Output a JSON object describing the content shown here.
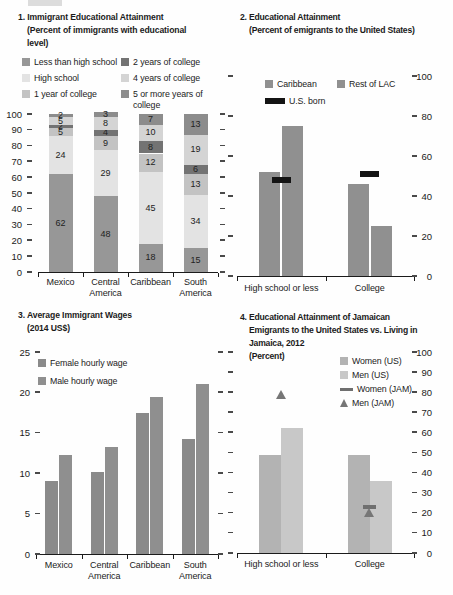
{
  "figure": {
    "kind": "four-panel statistical figure on immigrant education and wages"
  },
  "panels": {
    "p1": {
      "title_lines": [
        "1. Immigrant Educational Attainment",
        "(Percent of immigrants with educational",
        "level)"
      ],
      "legend": [
        {
          "label": "Less than high school",
          "color": "#979797"
        },
        {
          "label": "High school",
          "color": "#e3e3e3"
        },
        {
          "label": "1 year of college",
          "color": "#c3c3c3"
        },
        {
          "label": "2 years of college",
          "color": "#737373"
        },
        {
          "label": "4 years of college",
          "color": "#d4d4d4"
        },
        {
          "label": "5 or more years of college",
          "color": "#8c8c8c"
        }
      ]
    },
    "p2": {
      "title_lines": [
        "2. Educational Attainment",
        "(Percent of emigrants to the United States)"
      ],
      "legend": [
        {
          "label": "Caribbean",
          "color": "#909090"
        },
        {
          "label": "Rest of LAC",
          "color": "#909090"
        },
        {
          "label": "U.S. born",
          "color": "#141414"
        }
      ]
    },
    "p3": {
      "title_lines": [
        "3. Average Immigrant Wages",
        "(2014 US$)"
      ],
      "legend": [
        {
          "label": "Female hourly wage",
          "color": "#8a8a8a"
        },
        {
          "label": "Male hourly wage",
          "color": "#8f8f8f"
        }
      ]
    },
    "p4": {
      "title_lines": [
        "4. Educational Attainment of Jamaican",
        "Emigrants to the United States vs. Living in",
        "Jamaica, 2012",
        "(Percent)"
      ],
      "legend": [
        {
          "label": "Women (US)",
          "color": "#b3b3b3"
        },
        {
          "label": "Men (US)",
          "color": "#c8c8c8"
        },
        {
          "label": "Women (JAM)",
          "color": "#6f6f6f"
        },
        {
          "label": "Men (JAM)",
          "color": "#767676"
        }
      ]
    }
  },
  "chart_data": [
    {
      "id": "p1",
      "type": "bar",
      "subtype": "stacked",
      "title": "1. Immigrant Educational Attainment (Percent of immigrants with educational level)",
      "categories": [
        [
          "Mexico"
        ],
        [
          "Central",
          "America"
        ],
        [
          "Caribbean"
        ],
        [
          "South",
          "America"
        ]
      ],
      "series": [
        {
          "name": "Less than high school",
          "color": "#979797",
          "values": [
            62,
            48,
            18,
            15
          ]
        },
        {
          "name": "High school",
          "color": "#e3e3e3",
          "values": [
            24,
            29,
            45,
            34
          ]
        },
        {
          "name": "1 year of college",
          "color": "#c3c3c3",
          "values": [
            5,
            9,
            12,
            13
          ]
        },
        {
          "name": "2 years of college",
          "color": "#737373",
          "values": [
            2,
            4,
            8,
            6
          ]
        },
        {
          "name": "4 years of college",
          "color": "#d4d4d4",
          "values": [
            5,
            8,
            10,
            19
          ]
        },
        {
          "name": "5 or more years of college",
          "color": "#8c8c8c",
          "values": [
            2,
            3,
            7,
            13
          ]
        }
      ],
      "show_values": true,
      "ylim": [
        0,
        100
      ],
      "ticks": [
        0,
        10,
        20,
        30,
        40,
        50,
        60,
        70,
        80,
        90,
        100
      ],
      "axis_label_side": "left"
    },
    {
      "id": "p2",
      "type": "bar",
      "subtype": "grouped",
      "title": "2. Educational Attainment (Percent of emigrants to the United States)",
      "categories": [
        [
          "High school or less"
        ],
        [
          "College"
        ]
      ],
      "series": [
        {
          "name": "Caribbean",
          "color": "#909090",
          "values": [
            52,
            46
          ]
        },
        {
          "name": "Rest of LAC",
          "color": "#909090",
          "values": [
            75,
            25
          ]
        }
      ],
      "markers": [
        {
          "name": "U.S. born",
          "type": "dash",
          "color": "#141414",
          "w": 19,
          "h": 6,
          "values": [
            48,
            51
          ]
        }
      ],
      "show_values": false,
      "ylim": [
        0,
        100
      ],
      "ticks": [
        0,
        20,
        40,
        60,
        80,
        100
      ],
      "axis_label_side": "right"
    },
    {
      "id": "p3",
      "type": "bar",
      "subtype": "grouped",
      "title": "3. Average Immigrant Wages (2014 US$)",
      "categories": [
        [
          "Mexico"
        ],
        [
          "Central",
          "America"
        ],
        [
          "Caribbean"
        ],
        [
          "South",
          "America"
        ]
      ],
      "series": [
        {
          "name": "Female hourly wage",
          "color": "#8a8a8a",
          "values": [
            9,
            10.2,
            17.5,
            14.2
          ]
        },
        {
          "name": "Male hourly wage",
          "color": "#8f8f8f",
          "values": [
            12.3,
            13.3,
            19.4,
            21
          ]
        }
      ],
      "show_values": false,
      "ylim": [
        0,
        25
      ],
      "ticks": [
        0,
        5,
        10,
        15,
        20,
        25
      ],
      "axis_label_side": "left"
    },
    {
      "id": "p4",
      "type": "bar",
      "subtype": "grouped",
      "title": "4. Educational Attainment of Jamaican Emigrants to the United States vs. Living in Jamaica, 2012 (Percent)",
      "categories": [
        [
          "High school or less"
        ],
        [
          "College"
        ]
      ],
      "series": [
        {
          "name": "Women (US)",
          "color": "#b3b3b3",
          "values": [
            49,
            49
          ]
        },
        {
          "name": "Men (US)",
          "color": "#c8c8c8",
          "values": [
            62,
            36
          ]
        }
      ],
      "markers": [
        {
          "name": "Women (JAM)",
          "type": "dash",
          "color": "#6f6f6f",
          "w": 13,
          "h": 4,
          "values": [
            null,
            23
          ]
        },
        {
          "name": "Men (JAM)",
          "type": "triangle",
          "color": "#767676",
          "w": 11,
          "h": 9,
          "values": [
            79,
            20
          ]
        }
      ],
      "show_values": false,
      "ylim": [
        0,
        100
      ],
      "ticks": [
        0,
        10,
        20,
        30,
        40,
        50,
        60,
        70,
        80,
        90,
        100
      ],
      "axis_label_side": "right"
    }
  ]
}
